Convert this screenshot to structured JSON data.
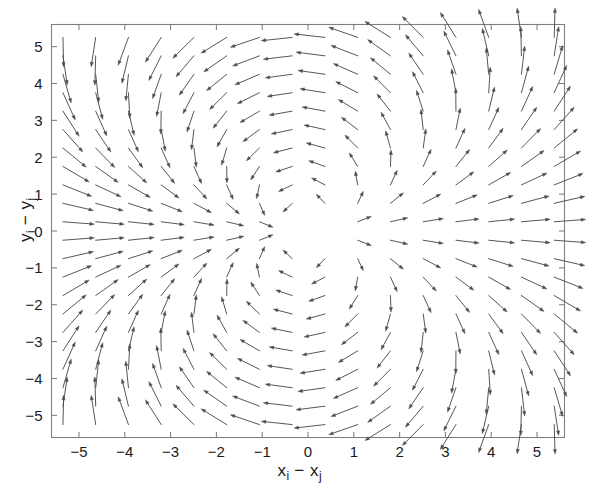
{
  "figure": {
    "background": "#ffffff",
    "frame_color": "#808080",
    "arrow_color": "#4d4d4d"
  },
  "axis_labels": {
    "x": {
      "base1": "x",
      "sub1": "i",
      "minus": " − ",
      "base2": "x",
      "sub2": "j"
    },
    "y": {
      "base1": "y",
      "sub1": "i",
      "minus": " − ",
      "base2": "y",
      "sub2": "j"
    }
  },
  "chart_data": {
    "type": "scatter",
    "plot_kind": "quiver",
    "title": "",
    "xlabel": "x_i - x_j",
    "ylabel": "y_i - y_j",
    "xlim": [
      -5.6,
      5.6
    ],
    "ylim": [
      -5.6,
      5.6
    ],
    "xticks": [
      -5,
      -4,
      -3,
      -2,
      -1,
      0,
      1,
      2,
      3,
      4,
      5
    ],
    "xticklabels": [
      "−5",
      "−4",
      "−3",
      "−2",
      "−1",
      "0",
      "1",
      "2",
      "3",
      "4",
      "5"
    ],
    "yticks": [
      -5,
      -4,
      -3,
      -2,
      -1,
      0,
      1,
      2,
      3,
      4,
      5
    ],
    "yticklabels": [
      "−5",
      "−4",
      "−3",
      "−2",
      "−1",
      "0",
      "1",
      "2",
      "3",
      "4",
      "5"
    ],
    "grid": false,
    "legend": null,
    "annotations": [],
    "field": {
      "description": "Two-dimensional dipole interaction vector field on a regular grid; arrows diverge from a singular point near the origin, flowing left in the left half-plane and right in the right half-plane, with vertical sweep above and below.",
      "model": "dipole",
      "singularity": [
        0.0,
        0.0
      ],
      "grid_nx": 16,
      "grid_ny": 22,
      "grid_x_start": -5.35,
      "grid_x_step": 0.715,
      "grid_y_start": -5.25,
      "grid_y_step": 0.5,
      "arrow_scale": 0.62,
      "head_length": 4.6,
      "head_width": 3.2
    }
  }
}
